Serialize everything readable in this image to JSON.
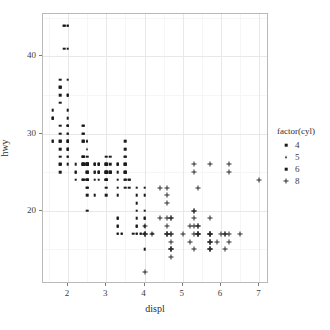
{
  "chart_data": {
    "type": "scatter",
    "title": "",
    "xlabel": "displ",
    "ylabel": "hwy",
    "xlim": [
      1.35,
      7.25
    ],
    "ylim": [
      10.5,
      45.5
    ],
    "xticks": [
      2,
      3,
      4,
      5,
      6,
      7
    ],
    "yticks": [
      20,
      30,
      40
    ],
    "xminor": [
      1.5,
      2.5,
      3.5,
      4.5,
      5.5,
      6.5
    ],
    "yminor": [
      15,
      25,
      35,
      45
    ],
    "grid": true,
    "legend": {
      "title": "factor(cyl)",
      "position": "right",
      "entries": [
        {
          "label": "4",
          "shape": "square-small"
        },
        {
          "label": "5",
          "shape": "triangle"
        },
        {
          "label": "6",
          "shape": "square"
        },
        {
          "label": "8",
          "shape": "plus"
        }
      ]
    },
    "series": [
      {
        "name": "4",
        "shape": "square",
        "color": "#1a1a1a",
        "points": [
          [
            1.8,
            29
          ],
          [
            1.8,
            29
          ],
          [
            2.0,
            31
          ],
          [
            2.0,
            30
          ],
          [
            2.8,
            26
          ],
          [
            2.8,
            26
          ],
          [
            1.8,
            26
          ],
          [
            1.8,
            25
          ],
          [
            2.0,
            28
          ],
          [
            2.0,
            27
          ],
          [
            2.8,
            25
          ],
          [
            2.8,
            25
          ],
          [
            2.4,
            26
          ],
          [
            2.4,
            27
          ],
          [
            2.5,
            26
          ],
          [
            2.5,
            25
          ],
          [
            2.4,
            30
          ],
          [
            2.4,
            31
          ],
          [
            2.0,
            29
          ],
          [
            2.0,
            31
          ],
          [
            2.0,
            26
          ],
          [
            2.0,
            28
          ],
          [
            2.4,
            27
          ],
          [
            2.4,
            26
          ],
          [
            2.4,
            29
          ],
          [
            2.4,
            26
          ],
          [
            2.5,
            26
          ],
          [
            2.4,
            24
          ],
          [
            2.5,
            24
          ],
          [
            2.5,
            24
          ],
          [
            2.2,
            26
          ],
          [
            2.2,
            25
          ],
          [
            2.4,
            24
          ],
          [
            2.4,
            24
          ],
          [
            2.5,
            26
          ],
          [
            2.5,
            26
          ],
          [
            2.0,
            27
          ],
          [
            2.0,
            30
          ],
          [
            2.0,
            31
          ],
          [
            2.0,
            31
          ],
          [
            2.5,
            24
          ],
          [
            2.5,
            22
          ],
          [
            2.5,
            23
          ],
          [
            2.5,
            24
          ],
          [
            1.6,
            33
          ],
          [
            1.6,
            32
          ],
          [
            1.6,
            32
          ],
          [
            1.6,
            29
          ],
          [
            1.6,
            32
          ],
          [
            1.8,
            34
          ],
          [
            1.8,
            36
          ],
          [
            1.8,
            36
          ],
          [
            2.0,
            29
          ],
          [
            2.4,
            26
          ],
          [
            2.4,
            27
          ],
          [
            2.4,
            30
          ],
          [
            2.4,
            31
          ],
          [
            2.5,
            26
          ],
          [
            2.5,
            26
          ],
          [
            3.3,
            17
          ],
          [
            2.0,
            35
          ],
          [
            2.0,
            37
          ],
          [
            2.0,
            35
          ],
          [
            2.0,
            44
          ],
          [
            2.0,
            44
          ],
          [
            2.0,
            41
          ],
          [
            1.9,
            44
          ],
          [
            1.9,
            44
          ],
          [
            1.9,
            41
          ],
          [
            2.0,
            33
          ],
          [
            2.0,
            29
          ],
          [
            2.0,
            32
          ],
          [
            2.5,
            23
          ],
          [
            2.5,
            24
          ],
          [
            2.5,
            20
          ],
          [
            2.5,
            26
          ],
          [
            2.2,
            25
          ],
          [
            2.2,
            24
          ],
          [
            2.5,
            27
          ],
          [
            2.5,
            25
          ],
          [
            1.8,
            35
          ],
          [
            1.8,
            37
          ],
          [
            1.8,
            31
          ],
          [
            1.8,
            30
          ],
          [
            2.4,
            29
          ],
          [
            2.4,
            27
          ],
          [
            2.7,
            26
          ],
          [
            2.7,
            25
          ],
          [
            3.0,
            25
          ],
          [
            3.0,
            25
          ],
          [
            1.8,
            28
          ],
          [
            1.8,
            27
          ],
          [
            2.0,
            29
          ],
          [
            2.0,
            28
          ],
          [
            2.7,
            26
          ],
          [
            3.0,
            24
          ],
          [
            2.7,
            22
          ],
          [
            3.0,
            22
          ],
          [
            3.0,
            26
          ],
          [
            3.3,
            26
          ],
          [
            3.3,
            26
          ],
          [
            3.5,
            29
          ],
          [
            1.6,
            29
          ],
          [
            1.8,
            26
          ],
          [
            2.4,
            26
          ],
          [
            2.5,
            25
          ],
          [
            2.7,
            24
          ],
          [
            3.0,
            24
          ]
        ]
      },
      {
        "name": "5",
        "shape": "triangle",
        "color": "#1a1a1a",
        "points": [
          [
            2.5,
            29
          ],
          [
            2.5,
            29
          ],
          [
            2.5,
            28
          ],
          [
            2.5,
            29
          ]
        ]
      },
      {
        "name": "6",
        "shape": "square",
        "color": "#1a1a1a",
        "points": [
          [
            2.8,
            26
          ],
          [
            2.8,
            25
          ],
          [
            3.1,
            27
          ],
          [
            3.1,
            25
          ],
          [
            3.1,
            25
          ],
          [
            3.1,
            26
          ],
          [
            2.8,
            24
          ],
          [
            3.1,
            25
          ],
          [
            3.6,
            24
          ],
          [
            3.0,
            24
          ],
          [
            3.3,
            22
          ],
          [
            3.3,
            19
          ],
          [
            3.8,
            20
          ],
          [
            3.8,
            17
          ],
          [
            4.0,
            17
          ],
          [
            3.7,
            17
          ],
          [
            3.9,
            17
          ],
          [
            3.9,
            17
          ],
          [
            4.0,
            19
          ],
          [
            3.0,
            23
          ],
          [
            3.0,
            24
          ],
          [
            3.3,
            25
          ],
          [
            3.3,
            26
          ],
          [
            3.5,
            26
          ],
          [
            3.5,
            25
          ],
          [
            3.5,
            24
          ],
          [
            3.5,
            27
          ],
          [
            3.5,
            28
          ],
          [
            3.0,
            26
          ],
          [
            3.0,
            25
          ],
          [
            3.5,
            25
          ],
          [
            3.5,
            24
          ],
          [
            3.3,
            17
          ],
          [
            3.3,
            19
          ],
          [
            3.8,
            19
          ],
          [
            3.8,
            18
          ],
          [
            4.0,
            20
          ],
          [
            4.0,
            19
          ],
          [
            4.0,
            18
          ],
          [
            4.0,
            17
          ],
          [
            4.2,
            17
          ],
          [
            4.0,
            17
          ],
          [
            3.8,
            17
          ],
          [
            3.8,
            18
          ],
          [
            4.0,
            17
          ],
          [
            2.7,
            26
          ],
          [
            2.7,
            25
          ],
          [
            3.0,
            26
          ],
          [
            3.0,
            25
          ],
          [
            3.5,
            26
          ],
          [
            3.5,
            27
          ],
          [
            3.6,
            24
          ],
          [
            3.6,
            23
          ],
          [
            3.8,
            23
          ],
          [
            3.8,
            22
          ],
          [
            3.8,
            21
          ],
          [
            4.0,
            23
          ],
          [
            4.0,
            22
          ],
          [
            3.3,
            18
          ],
          [
            3.3,
            18
          ],
          [
            3.4,
            17
          ],
          [
            3.4,
            17
          ],
          [
            4.0,
            15
          ],
          [
            3.0,
            27
          ],
          [
            3.0,
            26
          ],
          [
            3.0,
            25
          ],
          [
            3.5,
            26
          ],
          [
            3.5,
            25
          ],
          [
            3.0,
            24
          ],
          [
            3.3,
            24
          ],
          [
            3.3,
            23
          ],
          [
            3.5,
            23
          ]
        ]
      },
      {
        "name": "8",
        "shape": "plus",
        "color": "#2a2a2a",
        "points": [
          [
            5.3,
            20
          ],
          [
            5.3,
            15
          ],
          [
            5.3,
            20
          ],
          [
            5.7,
            17
          ],
          [
            6.0,
            17
          ],
          [
            5.7,
            17
          ],
          [
            5.7,
            17
          ],
          [
            6.2,
            17
          ],
          [
            6.2,
            16
          ],
          [
            7.0,
            24
          ],
          [
            5.3,
            25
          ],
          [
            5.3,
            26
          ],
          [
            5.7,
            26
          ],
          [
            6.5,
            17
          ],
          [
            5.7,
            17
          ],
          [
            6.2,
            26
          ],
          [
            6.2,
            25
          ],
          [
            4.6,
            19
          ],
          [
            5.4,
            18
          ],
          [
            5.4,
            17
          ],
          [
            4.0,
            17
          ],
          [
            4.2,
            17
          ],
          [
            4.6,
            17
          ],
          [
            4.6,
            18
          ],
          [
            4.6,
            17
          ],
          [
            5.4,
            17
          ],
          [
            5.4,
            18
          ],
          [
            4.7,
            19
          ],
          [
            5.7,
            19
          ],
          [
            6.1,
            17
          ],
          [
            4.0,
            17
          ],
          [
            4.7,
            15
          ],
          [
            4.7,
            15
          ],
          [
            4.7,
            16
          ],
          [
            5.7,
            15
          ],
          [
            6.1,
            15
          ],
          [
            4.0,
            12
          ],
          [
            4.7,
            17
          ],
          [
            4.7,
            17
          ],
          [
            5.7,
            16
          ],
          [
            5.7,
            16
          ],
          [
            6.1,
            17
          ],
          [
            4.7,
            14
          ],
          [
            4.7,
            15
          ],
          [
            5.7,
            15
          ],
          [
            5.7,
            15
          ],
          [
            5.2,
            16
          ],
          [
            5.7,
            16
          ],
          [
            5.9,
            16
          ],
          [
            4.6,
            17
          ],
          [
            5.4,
            17
          ],
          [
            5.4,
            17
          ],
          [
            4.0,
            18
          ],
          [
            4.0,
            17
          ],
          [
            4.6,
            21
          ],
          [
            4.6,
            22
          ],
          [
            4.6,
            23
          ],
          [
            5.4,
            23
          ],
          [
            4.4,
            23
          ],
          [
            4.4,
            19
          ],
          [
            5.3,
            19
          ],
          [
            4.7,
            19
          ],
          [
            5.2,
            18
          ],
          [
            5.3,
            18
          ],
          [
            5.3,
            17
          ],
          [
            5.0,
            17
          ]
        ]
      }
    ]
  }
}
